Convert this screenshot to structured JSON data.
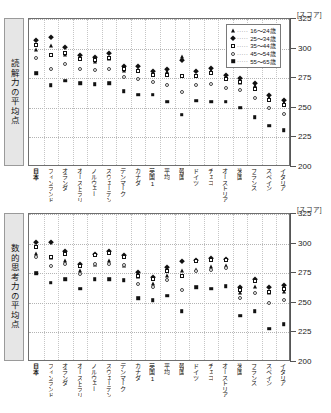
{
  "top_caption": "",
  "legend": {
    "position": "top-right",
    "items": [
      {
        "marker": "tri",
        "label": "16～24歳"
      },
      {
        "marker": "dia",
        "label": "25～34歳"
      },
      {
        "marker": "sqo",
        "label": "35～44歳"
      },
      {
        "marker": "cio",
        "label": "45～54歳"
      },
      {
        "marker": "sqf",
        "label": "55～65歳"
      }
    ],
    "dots": "·····"
  },
  "unit_label": "[スコア]",
  "chart_data": [
    {
      "type": "scatter",
      "title": "読解力の平均点",
      "ylabel": "読解力の平均点",
      "xlabel": "",
      "ylim": [
        200,
        325
      ],
      "yticks": [
        325,
        300,
        275,
        250,
        225,
        200
      ],
      "ytick_labels": [
        "325",
        "300",
        "275",
        "250",
        "225",
        "200"
      ],
      "grid": true,
      "legend_position": "top-right",
      "categories": [
        "日本",
        "フィンランド",
        "オランダ",
        "オーストラリア",
        "ノルウェー",
        "スウェーデン",
        "デンマーク",
        "カナダ",
        "英国1",
        "平均",
        "韓国",
        "ドイツ",
        "チェコ",
        "オーストリア",
        "米国",
        "フランス",
        "スペイン",
        "イタリア"
      ],
      "series": [
        {
          "name": "16～24歳",
          "marker": "tri",
          "values": [
            299,
            302,
            295,
            291,
            289,
            291,
            281,
            282,
            279,
            280,
            293,
            277,
            281,
            274,
            271,
            268,
            258,
            254
          ]
        },
        {
          "name": "25～34歳",
          "marker": "dia",
          "values": [
            307,
            310,
            301,
            295,
            293,
            296,
            285,
            285,
            281,
            283,
            290,
            281,
            284,
            278,
            275,
            271,
            261,
            257
          ]
        },
        {
          "name": "35～44歳",
          "marker": "sqo",
          "values": [
            303,
            295,
            296,
            291,
            290,
            292,
            283,
            281,
            278,
            278,
            277,
            277,
            279,
            274,
            272,
            266,
            257,
            252
          ]
        },
        {
          "name": "45～54歳",
          "marker": "cio",
          "values": [
            292,
            283,
            287,
            283,
            282,
            283,
            276,
            274,
            272,
            269,
            263,
            269,
            270,
            267,
            265,
            258,
            250,
            245
          ]
        },
        {
          "name": "55～65歳",
          "marker": "sqf",
          "values": [
            279,
            269,
            273,
            271,
            270,
            271,
            264,
            261,
            261,
            255,
            244,
            256,
            255,
            255,
            250,
            242,
            235,
            231
          ]
        }
      ]
    },
    {
      "type": "scatter",
      "title": "数的思考力の平均点",
      "ylabel": "数的思考力の平均点",
      "xlabel": "",
      "ylim": [
        200,
        325
      ],
      "yticks": [
        325,
        300,
        275,
        250,
        225,
        200
      ],
      "ytick_labels": [
        "325",
        "300",
        "275",
        "250",
        "225",
        "200"
      ],
      "grid": true,
      "legend_position": "none",
      "categories": [
        "日本",
        "フィンランド",
        "オランダ",
        "オーストラリア",
        "ノルウェー",
        "スウェーデン",
        "デンマーク",
        "カナダ",
        "英国1",
        "平均",
        "韓国",
        "ドイツ",
        "チェコ",
        "オーストリア",
        "米国",
        "フランス",
        "スペイン",
        "イタリア"
      ],
      "series": [
        {
          "name": "16～24歳",
          "marker": "tri",
          "values": [
            291,
            288,
            285,
            277,
            282,
            285,
            281,
            272,
            266,
            273,
            277,
            278,
            280,
            281,
            258,
            263,
            258,
            259
          ]
        },
        {
          "name": "25～34歳",
          "marker": "dia",
          "values": [
            301,
            301,
            294,
            283,
            291,
            294,
            290,
            276,
            272,
            280,
            285,
            286,
            288,
            287,
            263,
            270,
            263,
            265
          ]
        },
        {
          "name": "35～44歳",
          "marker": "sqo",
          "values": [
            297,
            289,
            291,
            281,
            290,
            292,
            289,
            273,
            270,
            277,
            273,
            285,
            286,
            286,
            261,
            268,
            259,
            262
          ]
        },
        {
          "name": "45～54歳",
          "marker": "cio",
          "values": [
            289,
            281,
            283,
            274,
            283,
            283,
            282,
            266,
            263,
            269,
            261,
            277,
            278,
            279,
            254,
            258,
            250,
            252
          ]
        },
        {
          "name": "55～65歳",
          "marker": "sqf",
          "values": [
            275,
            267,
            270,
            262,
            270,
            270,
            269,
            254,
            252,
            256,
            243,
            263,
            262,
            264,
            239,
            243,
            228,
            232
          ]
        }
      ]
    }
  ]
}
